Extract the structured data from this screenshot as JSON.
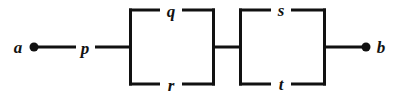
{
  "diagram": {
    "type": "series-parallel-network",
    "colors": {
      "background": "#ffffff",
      "stroke": "#111111",
      "node_fill": "#111111"
    },
    "geometry": {
      "width": 398,
      "height": 95,
      "midline_y": 47,
      "top_rail_y": 10,
      "bottom_rail_y": 84,
      "stroke_width": 3,
      "node_radius": 4.5
    },
    "terminals": [
      {
        "id": "a",
        "label": "a",
        "label_x": 18,
        "label_y": 47,
        "node_x": 34,
        "node_y": 47
      },
      {
        "id": "b",
        "label": "b",
        "label_x": 381,
        "label_y": 47,
        "node_x": 366,
        "node_y": 47
      }
    ],
    "edges": [
      {
        "id": "p",
        "label": "p",
        "label_x": 85,
        "label_y": 47,
        "position": "series-left"
      },
      {
        "id": "q",
        "label": "q",
        "label_x": 171,
        "label_y": 10,
        "position": "block1-top"
      },
      {
        "id": "r",
        "label": "r",
        "label_x": 171,
        "label_y": 84,
        "position": "block1-bottom"
      },
      {
        "id": "s",
        "label": "s",
        "label_x": 281,
        "label_y": 10,
        "position": "block2-top"
      },
      {
        "id": "t",
        "label": "t",
        "label_x": 281,
        "label_y": 84,
        "position": "block2-bottom"
      }
    ],
    "blocks": [
      {
        "id": "block-1",
        "left_x": 129,
        "right_x": 215,
        "top_y": 10,
        "bottom_y": 84,
        "top_edge": "q",
        "bottom_edge": "r"
      },
      {
        "id": "block-2",
        "left_x": 239,
        "right_x": 326,
        "top_y": 10,
        "bottom_y": 84,
        "top_edge": "s",
        "bottom_edge": "t"
      }
    ],
    "connectors": [
      {
        "id": "lead-a-to-p",
        "x1": 34,
        "y1": 47,
        "x2": 76,
        "y2": 47
      },
      {
        "id": "lead-p-to-block1",
        "x1": 95,
        "y1": 47,
        "x2": 129,
        "y2": 47
      },
      {
        "id": "lead-block1-to-block2",
        "x1": 215,
        "y1": 47,
        "x2": 239,
        "y2": 47
      },
      {
        "id": "lead-block2-to-b",
        "x1": 326,
        "y1": 47,
        "x2": 366,
        "y2": 47
      }
    ]
  }
}
